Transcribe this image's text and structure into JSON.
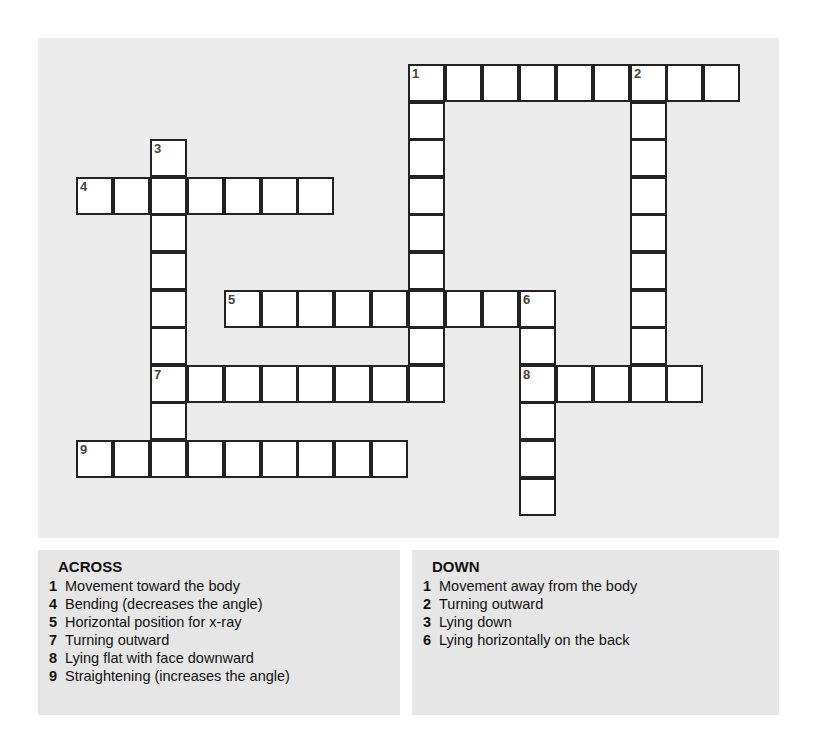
{
  "puzzle": {
    "grid": {
      "cell_w": 36.9,
      "cell_h": 37.6,
      "origin_x": 76,
      "origin_y": 64,
      "entries": [
        {
          "number": "1",
          "dir": "across",
          "row": 0,
          "col": 9,
          "length": 9
        },
        {
          "number": "1",
          "dir": "down",
          "row": 0,
          "col": 9,
          "length": 9
        },
        {
          "number": "2",
          "dir": "down",
          "row": 0,
          "col": 15,
          "length": 9
        },
        {
          "number": "3",
          "dir": "down",
          "row": 2,
          "col": 2,
          "length": 9
        },
        {
          "number": "4",
          "dir": "across",
          "row": 3,
          "col": 0,
          "length": 7
        },
        {
          "number": "5",
          "dir": "across",
          "row": 6,
          "col": 4,
          "length": 9
        },
        {
          "number": "6",
          "dir": "down",
          "row": 6,
          "col": 12,
          "length": 6
        },
        {
          "number": "7",
          "dir": "across",
          "row": 8,
          "col": 2,
          "length": 8
        },
        {
          "number": "8",
          "dir": "across",
          "row": 8,
          "col": 12,
          "length": 5
        },
        {
          "number": "9",
          "dir": "across",
          "row": 10,
          "col": 0,
          "length": 9
        }
      ]
    },
    "across": {
      "title": "ACROSS",
      "clues": [
        {
          "number": "1",
          "text": "Movement toward the body"
        },
        {
          "number": "4",
          "text": "Bending (decreases the angle)"
        },
        {
          "number": "5",
          "text": "Horizontal position for x-ray"
        },
        {
          "number": "7",
          "text": "Turning outward"
        },
        {
          "number": "8",
          "text": "Lying flat with face downward"
        },
        {
          "number": "9",
          "text": "Straightening (increases the angle)"
        }
      ]
    },
    "down": {
      "title": "DOWN",
      "clues": [
        {
          "number": "1",
          "text": "Movement away from the body"
        },
        {
          "number": "2",
          "text": "Turning outward"
        },
        {
          "number": "3",
          "text": "Lying down"
        },
        {
          "number": "6",
          "text": "Lying horizontally on the back"
        }
      ]
    }
  }
}
